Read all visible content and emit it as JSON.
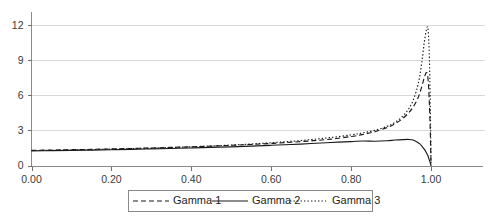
{
  "chart_data": {
    "type": "line",
    "title": "",
    "xlabel": "",
    "ylabel": "",
    "grid": true,
    "legend_position": "bottom",
    "xlim": [
      0.0,
      1.04
    ],
    "ylim": [
      0,
      12.8
    ],
    "xticks": [
      0.0,
      0.2,
      0.4,
      0.6,
      0.8,
      1.0
    ],
    "xtick_labels": [
      "0.00",
      "0.20",
      "0.40",
      "0.60",
      "0.80",
      "1.00"
    ],
    "yticks": [
      0,
      3,
      6,
      9,
      12
    ],
    "ytick_labels": [
      "0",
      "3",
      "6",
      "9",
      "12"
    ],
    "x": [
      0.0,
      0.05,
      0.1,
      0.15,
      0.2,
      0.25,
      0.3,
      0.35,
      0.4,
      0.45,
      0.5,
      0.55,
      0.6,
      0.65,
      0.7,
      0.75,
      0.8,
      0.83,
      0.86,
      0.89,
      0.91,
      0.93,
      0.945,
      0.955,
      0.965,
      0.972,
      0.978,
      0.983,
      0.988,
      0.992,
      0.995,
      0.997,
      0.999,
      1.0
    ],
    "series": [
      {
        "name": "Gamma 1",
        "style": "dashed",
        "color": "#1a1a1a",
        "values": [
          1.3,
          1.32,
          1.35,
          1.38,
          1.42,
          1.46,
          1.5,
          1.55,
          1.6,
          1.66,
          1.73,
          1.8,
          1.89,
          1.99,
          2.11,
          2.26,
          2.48,
          2.66,
          2.9,
          3.25,
          3.58,
          4.05,
          4.55,
          5.0,
          5.6,
          6.2,
          6.9,
          7.5,
          7.95,
          7.6,
          6.0,
          4.2,
          1.8,
          0.0
        ]
      },
      {
        "name": "Gamma 2",
        "style": "solid",
        "color": "#1a1a1a",
        "values": [
          1.25,
          1.27,
          1.29,
          1.32,
          1.35,
          1.38,
          1.42,
          1.46,
          1.5,
          1.55,
          1.6,
          1.66,
          1.73,
          1.8,
          1.88,
          1.97,
          2.05,
          2.1,
          2.08,
          2.12,
          2.18,
          2.22,
          2.23,
          2.18,
          2.02,
          1.85,
          1.62,
          1.4,
          1.12,
          0.85,
          0.55,
          0.35,
          0.12,
          0.0
        ]
      },
      {
        "name": "Gamma 3",
        "style": "dotted",
        "color": "#1a1a1a",
        "values": [
          1.28,
          1.3,
          1.33,
          1.36,
          1.4,
          1.44,
          1.49,
          1.54,
          1.6,
          1.67,
          1.75,
          1.84,
          1.95,
          2.07,
          2.22,
          2.4,
          2.62,
          2.8,
          3.02,
          3.35,
          3.7,
          4.25,
          4.9,
          5.55,
          6.6,
          7.7,
          9.1,
          10.5,
          11.55,
          11.8,
          10.2,
          7.5,
          3.2,
          0.0
        ]
      }
    ]
  },
  "legend": {
    "items": [
      {
        "label": "Gamma 1",
        "style": "dashed"
      },
      {
        "label": "Gamma 2",
        "style": "solid"
      },
      {
        "label": "Gamma 3",
        "style": "dotted"
      }
    ]
  }
}
